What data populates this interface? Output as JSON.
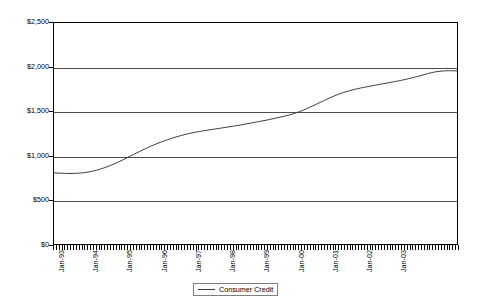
{
  "chart_data": {
    "type": "line",
    "title": "",
    "xlabel": "",
    "ylabel": "",
    "ylim": [
      0,
      2500
    ],
    "y_ticks": [
      0,
      500,
      1000,
      1500,
      2000,
      2500
    ],
    "y_tick_labels": [
      "$0",
      "$500",
      "$1,000",
      "$1,500",
      "$2,000",
      "$2,500"
    ],
    "grid": "horizontal",
    "legend_position": "bottom-center",
    "x_tick_labels": [
      "Jan-93",
      "Jan-94",
      "Jan-95",
      "Jan-96",
      "Jan-97",
      "Jan-98",
      "Jan-99",
      "Jan-00",
      "Jan-01",
      "Jan-02",
      "Jan-03"
    ],
    "x_minor_tick_interval": "monthly",
    "x_start": "Jan-93",
    "x_end": "Nov-03",
    "series": [
      {
        "name": "Consumer Credit",
        "color": "#3c3c3c",
        "units": "Billions of dollars",
        "values": [
          805,
          803,
          801,
          800,
          799,
          798,
          798,
          799,
          800,
          802,
          805,
          809,
          814,
          820,
          827,
          835,
          844,
          854,
          865,
          877,
          890,
          903,
          917,
          932,
          948,
          964,
          980,
          996,
          1012,
          1028,
          1044,
          1060,
          1075,
          1090,
          1104,
          1118,
          1132,
          1145,
          1157,
          1169,
          1180,
          1191,
          1201,
          1211,
          1220,
          1229,
          1237,
          1245,
          1252,
          1259,
          1265,
          1271,
          1277,
          1282,
          1287,
          1292,
          1297,
          1302,
          1307,
          1312,
          1317,
          1322,
          1327,
          1332,
          1337,
          1342,
          1348,
          1354,
          1360,
          1366,
          1372,
          1378,
          1384,
          1390,
          1396,
          1402,
          1409,
          1416,
          1423,
          1430,
          1437,
          1445,
          1453,
          1461,
          1470,
          1480,
          1491,
          1503,
          1516,
          1530,
          1545,
          1560,
          1575,
          1590,
          1605,
          1620,
          1635,
          1650,
          1664,
          1678,
          1691,
          1703,
          1714,
          1724,
          1733,
          1742,
          1750,
          1757,
          1764,
          1771,
          1777,
          1783,
          1789,
          1795,
          1801,
          1807,
          1813,
          1819,
          1825,
          1831,
          1837,
          1843,
          1849,
          1856,
          1863,
          1870,
          1878,
          1886,
          1894,
          1903,
          1912,
          1921,
          1930,
          1938,
          1945,
          1950,
          1954,
          1957,
          1959,
          1960,
          1960,
          1959,
          1958
        ]
      }
    ]
  },
  "legend": {
    "label": "Consumer Credit"
  }
}
